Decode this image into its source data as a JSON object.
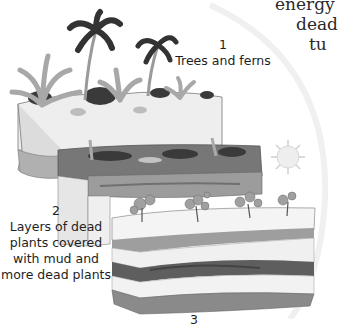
{
  "figure": {
    "body_text_fragments": [
      "energy",
      "dead",
      "tu"
    ],
    "stages": [
      {
        "number": "1",
        "caption": "Trees and ferns"
      },
      {
        "number": "2",
        "caption_lines": [
          "Layers of dead",
          "plants covered",
          "with mud and",
          "more dead plants"
        ]
      },
      {
        "number": "3"
      }
    ],
    "colors": {
      "background": "#ffffff",
      "block_light": "#ededed",
      "block_side": "#dedede",
      "layer_mid": "#9c9c9c",
      "layer_dark": "#5e5e5e",
      "foliage_dark": "#3a3a3a",
      "foliage_light": "#a8a8a8",
      "sun": "#e8e8e8"
    }
  }
}
